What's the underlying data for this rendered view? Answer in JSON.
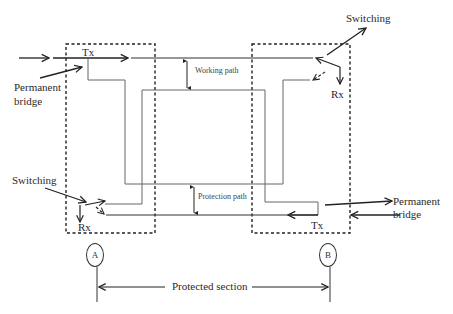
{
  "diagram": {
    "labels": {
      "tx_left": "Tx",
      "tx_right": "Tx",
      "rx_left": "Rx",
      "rx_right": "Rx",
      "switching_left": "Switching",
      "switching_right": "Switching",
      "permanent_bridge_left_1": "Permanent",
      "permanent_bridge_left_2": "bridge",
      "permanent_bridge_right_1": "Permanent",
      "permanent_bridge_right_2": "bridge",
      "working_path": "Working path",
      "protection_path": "Protection path",
      "protected_section": "Protected section"
    },
    "nodes": [
      {
        "id": "A",
        "label": "A"
      },
      {
        "id": "B",
        "label": "B"
      }
    ],
    "colors": {
      "line": "#333333",
      "thin_line": "#666666",
      "background": "#ffffff"
    }
  }
}
